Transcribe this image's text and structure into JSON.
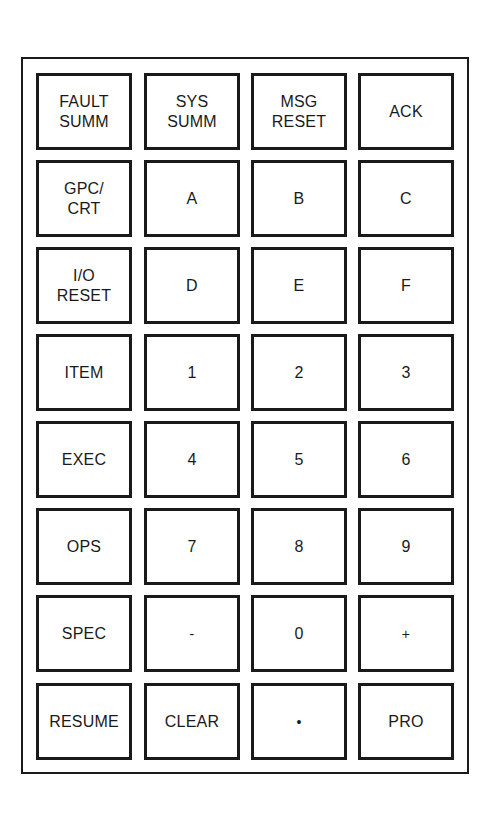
{
  "keypad": {
    "rows": [
      [
        "FAULT\nSUMM",
        "SYS\nSUMM",
        "MSG\nRESET",
        "ACK"
      ],
      [
        "GPC/\nCRT",
        "A",
        "B",
        "C"
      ],
      [
        "I/O\nRESET",
        "D",
        "E",
        "F"
      ],
      [
        "ITEM",
        "1",
        "2",
        "3"
      ],
      [
        "EXEC",
        "4",
        "5",
        "6"
      ],
      [
        "OPS",
        "7",
        "8",
        "9"
      ],
      [
        "SPEC",
        "-",
        "0",
        "+"
      ],
      [
        "RESUME",
        "CLEAR",
        "•",
        "PRO"
      ]
    ]
  }
}
